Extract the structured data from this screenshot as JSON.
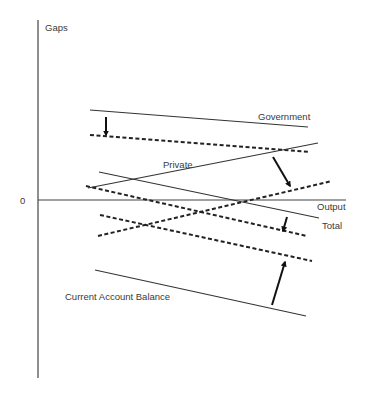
{
  "diagram": {
    "y_axis_label": "Gaps",
    "x_axis_label": "Output",
    "origin_label": "0",
    "labels": {
      "government": "Government",
      "private": "Private",
      "total": "Total",
      "current_account": "Current Account Balance"
    },
    "colors": {
      "line": "#333333",
      "background": "#ffffff"
    },
    "lines": [
      {
        "name": "government-initial",
        "style": "solid",
        "from": [
          90,
          110
        ],
        "to": [
          308,
          127
        ]
      },
      {
        "name": "government-shifted",
        "style": "dashed",
        "from": [
          90,
          135
        ],
        "to": [
          310,
          152
        ]
      },
      {
        "name": "private-initial",
        "style": "solid",
        "from": [
          88,
          188
        ],
        "to": [
          318,
          143
        ]
      },
      {
        "name": "private-shifted",
        "style": "dashed",
        "from": [
          98,
          236
        ],
        "to": [
          332,
          181
        ]
      },
      {
        "name": "total-initial",
        "style": "solid",
        "from": [
          99,
          172
        ],
        "to": [
          319,
          218
        ]
      },
      {
        "name": "total-shifted",
        "style": "dashed",
        "from": [
          86,
          186
        ],
        "to": [
          307,
          236
        ]
      },
      {
        "name": "current-account-shifted",
        "style": "dashed",
        "from": [
          100,
          215
        ],
        "to": [
          312,
          261
        ]
      },
      {
        "name": "current-account-initial",
        "style": "solid",
        "from": [
          95,
          270
        ],
        "to": [
          306,
          316
        ]
      }
    ],
    "arrows": [
      {
        "name": "government-shift-arrow",
        "from": [
          106,
          117
        ],
        "to": [
          106,
          135
        ]
      },
      {
        "name": "private-shift-arrow",
        "from": [
          273,
          157
        ],
        "to": [
          290,
          186
        ]
      },
      {
        "name": "total-shift-arrow",
        "from": [
          287,
          217
        ],
        "to": [
          283,
          231
        ]
      },
      {
        "name": "current-account-shift-arrow",
        "from": [
          272,
          305
        ],
        "to": [
          285,
          262
        ]
      }
    ]
  }
}
